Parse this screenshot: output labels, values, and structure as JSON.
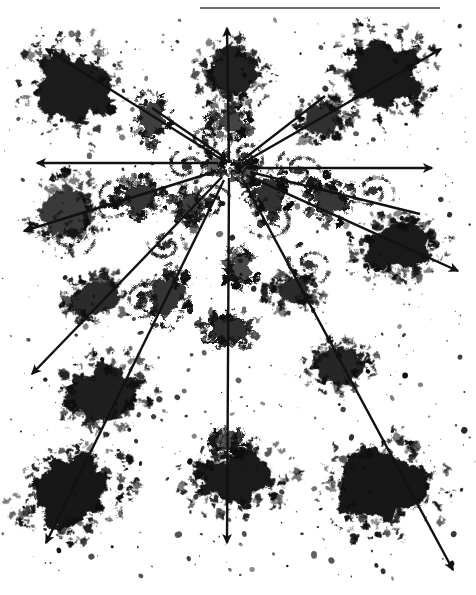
{
  "figure": {
    "title": "Radial vector field over clumped source distribution",
    "kind": "scanned-astronomical-plate",
    "width": 476,
    "height": 595,
    "background_color": "#ffffff",
    "ink_color": "#111111",
    "rule_color": "#6f6f6f"
  },
  "header_rule": {
    "name": "top-horizontal-rule",
    "x": 200,
    "y": 7,
    "width": 240,
    "thickness": 2,
    "color": "#6f6f6f"
  },
  "origin": {
    "label": "convergence-center",
    "x": 238,
    "y": 168
  },
  "vectors": [
    {
      "id": "v-up",
      "label": "N",
      "angle_deg": 90,
      "x1": 229,
      "y1": 163,
      "x2": 227,
      "y2": 28,
      "head": true
    },
    {
      "id": "v-up-right",
      "label": "NNE",
      "angle_deg": 62,
      "x1": 241,
      "y1": 161,
      "x2": 325,
      "y2": 96,
      "head": false
    },
    {
      "id": "v-upper-right",
      "label": "NE",
      "angle_deg": 36,
      "x1": 243,
      "y1": 163,
      "x2": 441,
      "y2": 49,
      "head": true
    },
    {
      "id": "v-right",
      "label": "E",
      "angle_deg": 0,
      "x1": 246,
      "y1": 168,
      "x2": 432,
      "y2": 168,
      "head": true
    },
    {
      "id": "v-lower-right",
      "label": "SE",
      "angle_deg": -28,
      "x1": 246,
      "y1": 175,
      "x2": 458,
      "y2": 271,
      "head": true
    },
    {
      "id": "v-down-right",
      "label": "SSE",
      "angle_deg": -55,
      "x1": 243,
      "y1": 180,
      "x2": 453,
      "y2": 570,
      "head": true
    },
    {
      "id": "v-down",
      "label": "S",
      "angle_deg": -90,
      "x1": 229,
      "y1": 178,
      "x2": 227,
      "y2": 543,
      "head": true
    },
    {
      "id": "v-down-left",
      "label": "SSW",
      "angle_deg": -118,
      "x1": 224,
      "y1": 180,
      "x2": 46,
      "y2": 543,
      "head": true
    },
    {
      "id": "v-lower-left",
      "label": "SW",
      "angle_deg": -142,
      "x1": 222,
      "y1": 177,
      "x2": 32,
      "y2": 374,
      "head": true
    },
    {
      "id": "v-left",
      "label": "W",
      "angle_deg": 180,
      "x1": 218,
      "y1": 163,
      "x2": 37,
      "y2": 163,
      "head": true
    },
    {
      "id": "v-upper-left",
      "label": "NW",
      "angle_deg": 145,
      "x1": 221,
      "y1": 159,
      "x2": 46,
      "y2": 49,
      "head": true
    },
    {
      "id": "v-up-left",
      "label": "NNW",
      "angle_deg": 118,
      "x1": 224,
      "y1": 157,
      "x2": 152,
      "y2": 108,
      "head": false
    },
    {
      "id": "v-left-low",
      "label": "WSW",
      "angle_deg": -160,
      "x1": 214,
      "y1": 172,
      "x2": 24,
      "y2": 231,
      "head": true
    },
    {
      "id": "v-right-low",
      "label": "ESE",
      "angle_deg": -12,
      "x1": 250,
      "y1": 172,
      "x2": 420,
      "y2": 214,
      "head": false
    }
  ],
  "clumps": [
    {
      "id": "c01",
      "cx": 72,
      "cy": 88,
      "rx": 36,
      "ry": 42,
      "rot": -25,
      "density": 0.94
    },
    {
      "id": "c02",
      "cx": 232,
      "cy": 72,
      "rx": 28,
      "ry": 26,
      "rot": 10,
      "density": 0.92
    },
    {
      "id": "c03",
      "cx": 382,
      "cy": 74,
      "rx": 38,
      "ry": 36,
      "rot": 18,
      "density": 0.95
    },
    {
      "id": "c04",
      "cx": 152,
      "cy": 119,
      "rx": 15,
      "ry": 19,
      "rot": 0,
      "density": 0.8
    },
    {
      "id": "c05",
      "cx": 230,
      "cy": 122,
      "rx": 16,
      "ry": 12,
      "rot": 0,
      "density": 0.78
    },
    {
      "id": "c06",
      "cx": 322,
      "cy": 121,
      "rx": 20,
      "ry": 17,
      "rot": -12,
      "density": 0.86
    },
    {
      "id": "c07",
      "cx": 66,
      "cy": 214,
      "rx": 26,
      "ry": 30,
      "rot": 30,
      "density": 0.82
    },
    {
      "id": "c08",
      "cx": 139,
      "cy": 198,
      "rx": 19,
      "ry": 16,
      "rot": 0,
      "density": 0.84
    },
    {
      "id": "c09",
      "cx": 190,
      "cy": 206,
      "rx": 13,
      "ry": 14,
      "rot": 0,
      "density": 0.8
    },
    {
      "id": "c10",
      "cx": 270,
      "cy": 196,
      "rx": 17,
      "ry": 20,
      "rot": 0,
      "density": 0.85
    },
    {
      "id": "c11",
      "cx": 330,
      "cy": 200,
      "rx": 18,
      "ry": 17,
      "rot": 0,
      "density": 0.83
    },
    {
      "id": "c12",
      "cx": 396,
      "cy": 248,
      "rx": 37,
      "ry": 24,
      "rot": -8,
      "density": 0.95
    },
    {
      "id": "c13",
      "cx": 96,
      "cy": 298,
      "rx": 24,
      "ry": 19,
      "rot": -18,
      "density": 0.88
    },
    {
      "id": "c14",
      "cx": 166,
      "cy": 297,
      "rx": 19,
      "ry": 22,
      "rot": 0,
      "density": 0.84
    },
    {
      "id": "c15",
      "cx": 241,
      "cy": 269,
      "rx": 12,
      "ry": 15,
      "rot": 0,
      "density": 0.76
    },
    {
      "id": "c16",
      "cx": 294,
      "cy": 290,
      "rx": 22,
      "ry": 15,
      "rot": -14,
      "density": 0.88
    },
    {
      "id": "c17",
      "cx": 230,
      "cy": 330,
      "rx": 22,
      "ry": 14,
      "rot": 0,
      "density": 0.86
    },
    {
      "id": "c18",
      "cx": 339,
      "cy": 366,
      "rx": 27,
      "ry": 19,
      "rot": -10,
      "density": 0.9
    },
    {
      "id": "c19",
      "cx": 104,
      "cy": 394,
      "rx": 36,
      "ry": 28,
      "rot": -22,
      "density": 0.93
    },
    {
      "id": "c20",
      "cx": 228,
      "cy": 442,
      "rx": 14,
      "ry": 11,
      "rot": 0,
      "density": 0.72
    },
    {
      "id": "c21",
      "cx": 72,
      "cy": 490,
      "rx": 44,
      "ry": 36,
      "rot": -20,
      "density": 0.96
    },
    {
      "id": "c22",
      "cx": 238,
      "cy": 478,
      "rx": 42,
      "ry": 27,
      "rot": -6,
      "density": 0.95
    },
    {
      "id": "c23",
      "cx": 386,
      "cy": 486,
      "rx": 48,
      "ry": 40,
      "rot": -14,
      "density": 0.96
    },
    {
      "id": "c24",
      "cx": 246,
      "cy": 172,
      "rx": 10,
      "ry": 10,
      "rot": 0,
      "density": 0.7
    },
    {
      "id": "c25",
      "cx": 214,
      "cy": 163,
      "rx": 9,
      "ry": 9,
      "rot": 0,
      "density": 0.66
    }
  ],
  "spirals": [
    {
      "id": "s01",
      "cx": 186,
      "cy": 166,
      "r": 20,
      "rot": 20
    },
    {
      "id": "s02",
      "cx": 244,
      "cy": 155,
      "r": 18,
      "rot": 140
    },
    {
      "id": "s03",
      "cx": 298,
      "cy": 170,
      "r": 22,
      "rot": -40
    },
    {
      "id": "s04",
      "cx": 208,
      "cy": 200,
      "r": 19,
      "rot": 75
    },
    {
      "id": "s05",
      "cx": 272,
      "cy": 216,
      "r": 26,
      "rot": -110
    },
    {
      "id": "s06",
      "cx": 114,
      "cy": 198,
      "r": 22,
      "rot": 55
    },
    {
      "id": "s07",
      "cx": 72,
      "cy": 232,
      "r": 24,
      "rot": 160
    },
    {
      "id": "s08",
      "cx": 372,
      "cy": 190,
      "r": 20,
      "rot": -65
    },
    {
      "id": "s09",
      "cx": 166,
      "cy": 244,
      "r": 17,
      "rot": 100
    },
    {
      "id": "s10",
      "cx": 308,
      "cy": 264,
      "r": 22,
      "rot": -20
    },
    {
      "id": "s11",
      "cx": 142,
      "cy": 300,
      "r": 19,
      "rot": 40
    },
    {
      "id": "s12",
      "cx": 204,
      "cy": 140,
      "r": 14,
      "rot": -150
    }
  ],
  "speck_field": {
    "count": 520,
    "min_radius": 0.5,
    "max_radius": 3.2,
    "seed": 20240917
  },
  "accessibility": {
    "figure_description": "Radial arrows emanating from a central convergence point across a field of dark clumped blobs and faint spiral structures, with a horizontal rule at the top of the plate."
  }
}
